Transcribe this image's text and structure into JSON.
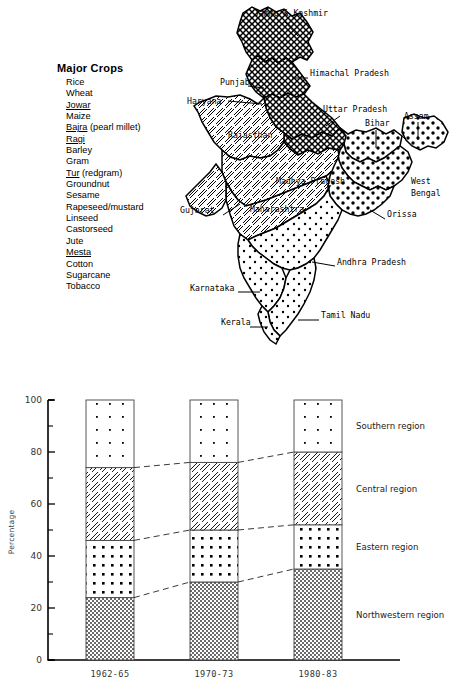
{
  "crops": {
    "title": "Major Crops",
    "items": [
      {
        "name": "Rice",
        "underline": false,
        "suffix": ""
      },
      {
        "name": "Wheat",
        "underline": false,
        "suffix": ""
      },
      {
        "name": "Jowar",
        "underline": true,
        "suffix": ""
      },
      {
        "name": "Maize",
        "underline": false,
        "suffix": ""
      },
      {
        "name": "Bajra",
        "underline": true,
        "suffix": " (pearl millet)"
      },
      {
        "name": "Ragi",
        "underline": true,
        "suffix": ""
      },
      {
        "name": "Barley",
        "underline": false,
        "suffix": ""
      },
      {
        "name": "Gram",
        "underline": false,
        "suffix": ""
      },
      {
        "name": "Tur",
        "underline": true,
        "suffix": " (redgram)"
      },
      {
        "name": "Groundnut",
        "underline": false,
        "suffix": ""
      },
      {
        "name": "Sesame",
        "underline": false,
        "suffix": ""
      },
      {
        "name": "Rapeseed/mustard",
        "underline": false,
        "suffix": ""
      },
      {
        "name": "Linseed",
        "underline": false,
        "suffix": ""
      },
      {
        "name": "Castorseed",
        "underline": false,
        "suffix": ""
      },
      {
        "name": "Jute",
        "underline": false,
        "suffix": ""
      },
      {
        "name": "Mesta",
        "underline": true,
        "suffix": ""
      },
      {
        "name": "Cotton",
        "underline": false,
        "suffix": ""
      },
      {
        "name": "Sugarcane",
        "underline": false,
        "suffix": ""
      },
      {
        "name": "Tobacco",
        "underline": false,
        "suffix": ""
      }
    ]
  },
  "map": {
    "labels": [
      {
        "id": "jammu-kashmir",
        "text": "Jammu & Kashmir",
        "x": 74,
        "y": 16
      },
      {
        "id": "himachal",
        "text": "Himachal Pradesh",
        "x": 130,
        "y": 76
      },
      {
        "id": "punjab",
        "text": "Punjab",
        "x": 40,
        "y": 85
      },
      {
        "id": "haryana",
        "text": "Haryana",
        "x": 7,
        "y": 104
      },
      {
        "id": "uttar-pradesh",
        "text": "Uttar Pradesh",
        "x": 143,
        "y": 112
      },
      {
        "id": "bihar",
        "text": "Bihar",
        "x": 185,
        "y": 126
      },
      {
        "id": "assam",
        "text": "Assam",
        "x": 224,
        "y": 119
      },
      {
        "id": "rajasthan",
        "text": "Rajasthan",
        "x": 48,
        "y": 138
      },
      {
        "id": "madhya-pradesh",
        "text": "Madhya Pradesh",
        "x": 96,
        "y": 184
      },
      {
        "id": "west",
        "text": "West",
        "x": 231,
        "y": 184
      },
      {
        "id": "bengal",
        "text": "Bengal",
        "x": 231,
        "y": 196
      },
      {
        "id": "gujarat",
        "text": "Gujarat",
        "x": 0,
        "y": 213
      },
      {
        "id": "maharashtra",
        "text": "Maharashtra",
        "x": 70,
        "y": 212
      },
      {
        "id": "orissa",
        "text": "Orissa",
        "x": 207,
        "y": 217
      },
      {
        "id": "andhra-pradesh",
        "text": "Andhra Pradesh",
        "x": 157,
        "y": 265
      },
      {
        "id": "karnataka",
        "text": "Karnataka",
        "x": 10,
        "y": 291
      },
      {
        "id": "tamil-nadu",
        "text": "Tamil Nadu",
        "x": 141,
        "y": 318
      },
      {
        "id": "kerala",
        "text": "Kerala",
        "x": 41,
        "y": 325
      }
    ]
  },
  "chart": {
    "legend": [
      {
        "key": "southern",
        "label": "Southern region"
      },
      {
        "key": "central",
        "label": "Central region"
      },
      {
        "key": "eastern",
        "label": "Eastern region"
      },
      {
        "key": "northwestern",
        "label": "Northwestern region"
      }
    ]
  },
  "chart_data": {
    "type": "bar",
    "subtype": "stacked-100",
    "title": "",
    "xlabel": "",
    "ylabel": "Percentage",
    "ylim": [
      0,
      100
    ],
    "ytick_step": 20,
    "yminor_step": 10,
    "grid": false,
    "legend_position": "right",
    "categories": [
      "1962-65",
      "1970-73",
      "1980-83"
    ],
    "ytick_labels": [
      "0",
      "20",
      "40",
      "60",
      "80",
      "100"
    ],
    "series": [
      {
        "name": "Northwestern region",
        "values": [
          24,
          30,
          35
        ],
        "pattern": "checker"
      },
      {
        "name": "Eastern region",
        "values": [
          22,
          20,
          17
        ],
        "pattern": "dots-dense"
      },
      {
        "name": "Central region",
        "values": [
          28,
          26,
          28
        ],
        "pattern": "hatch"
      },
      {
        "name": "Southern region",
        "values": [
          26,
          24,
          20
        ],
        "pattern": "dots-sparse"
      }
    ],
    "cumulative_boundaries": [
      {
        "category": "1962-65",
        "northwestern": 24,
        "eastern": 46,
        "central": 74,
        "southern": 100
      },
      {
        "category": "1970-73",
        "northwestern": 30,
        "eastern": 50,
        "central": 76,
        "southern": 100
      },
      {
        "category": "1980-83",
        "northwestern": 35,
        "eastern": 52,
        "central": 80,
        "southern": 100
      }
    ]
  }
}
